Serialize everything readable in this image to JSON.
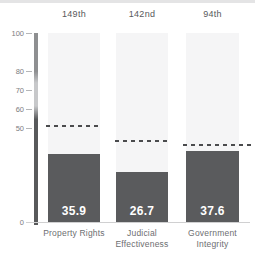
{
  "chart_data": {
    "type": "bar",
    "title": "",
    "xlabel": "",
    "ylabel": "",
    "categories": [
      "Property Rights",
      "Judicial Effectiveness",
      "Government Integrity"
    ],
    "values": [
      35.9,
      26.7,
      37.6
    ],
    "value_labels": [
      "35.9",
      "26.7",
      "37.6"
    ],
    "ranks": [
      "149th",
      "142nd",
      "94th"
    ],
    "dashed_reference_values": [
      51,
      43,
      41
    ],
    "ylim": [
      0,
      100
    ],
    "ytick_labels": [
      "100",
      "80",
      "70",
      "60",
      "50",
      "0"
    ],
    "ytick_values": [
      100,
      80,
      70,
      60,
      50,
      0
    ],
    "grid": false,
    "legend": false
  },
  "colors": {
    "bar": "#5a5b5d",
    "bar_background": "#f5f5f6",
    "value_text": "#ffffff",
    "label_text": "#6d6e71",
    "rank_text": "#58595b",
    "axis_text": "#7c7d80",
    "tick": "#b5b6b8",
    "dashed_line": "#4a4b4d",
    "baseline": "#d0d0d1",
    "axis_gradient_top": "#8e8f91",
    "axis_gradient_mid": "#c7c8ca",
    "axis_gradient_bottom": "#58595b",
    "top_strip": "#e4e4e5"
  }
}
